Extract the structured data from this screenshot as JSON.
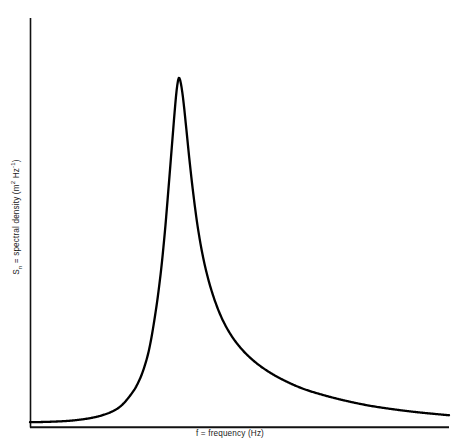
{
  "chart_data": {
    "type": "line",
    "title": "",
    "xlabel": "f = frequency (Hz)",
    "ylabel_text": "S",
    "ylabel_sub": "n",
    "ylabel_mid": " = spectral density (m",
    "ylabel_sup1": "2",
    "ylabel_unit": " Hz",
    "ylabel_sup2": "-1",
    "ylabel_close": ")",
    "ylabel_full": "S_n = spectral density (m2 Hz-1)",
    "axes": {
      "x_axis_shown": true,
      "y_axis_shown": true,
      "x_ticks": [],
      "y_ticks": [],
      "grid": false,
      "tick_labels_shown": false,
      "legend": "none"
    },
    "peak": {
      "x": 0.355,
      "y": 1.0
    },
    "x": [
      0.0,
      0.04,
      0.08,
      0.11,
      0.14,
      0.17,
      0.2,
      0.22,
      0.24,
      0.255,
      0.27,
      0.285,
      0.3,
      0.312,
      0.322,
      0.331,
      0.339,
      0.345,
      0.35,
      0.355,
      0.36,
      0.366,
      0.373,
      0.381,
      0.39,
      0.4,
      0.412,
      0.426,
      0.442,
      0.46,
      0.482,
      0.508,
      0.538,
      0.572,
      0.61,
      0.652,
      0.7,
      0.752,
      0.808,
      0.868,
      0.93,
      1.0
    ],
    "y": [
      0.012,
      0.013,
      0.015,
      0.018,
      0.023,
      0.031,
      0.045,
      0.062,
      0.09,
      0.118,
      0.16,
      0.225,
      0.33,
      0.44,
      0.56,
      0.69,
      0.81,
      0.9,
      0.965,
      1.0,
      0.985,
      0.935,
      0.855,
      0.76,
      0.665,
      0.575,
      0.492,
      0.42,
      0.358,
      0.305,
      0.258,
      0.218,
      0.184,
      0.155,
      0.13,
      0.108,
      0.09,
      0.074,
      0.06,
      0.049,
      0.04,
      0.032
    ],
    "ylim": [
      0,
      1.08
    ],
    "xlim": [
      0,
      1.0
    ],
    "curve_color": "#000000",
    "axis_color": "#111111",
    "background_color": "#ffffff"
  },
  "figure": {
    "width": 452,
    "height": 444
  }
}
